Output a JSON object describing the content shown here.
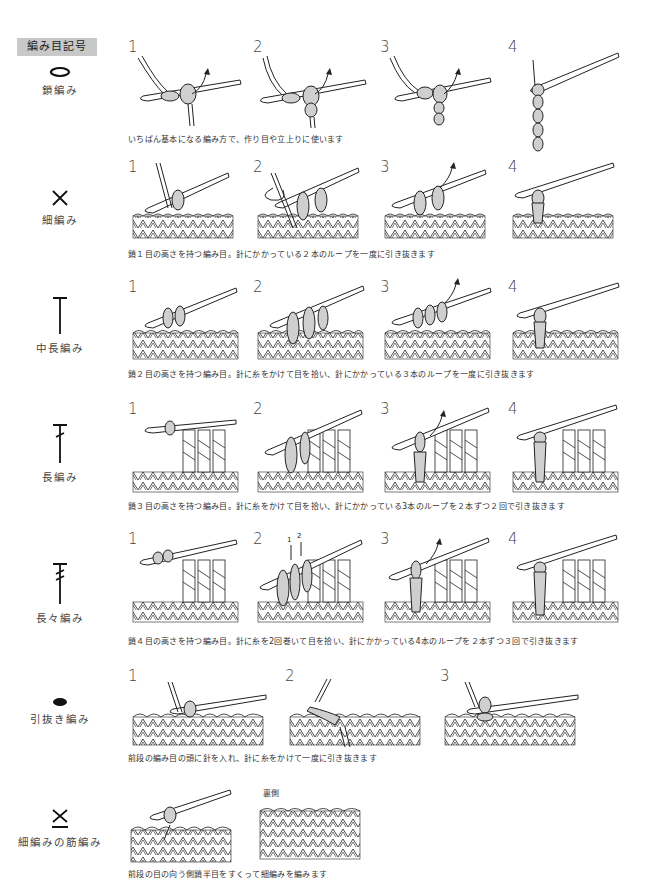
{
  "header": {
    "label": "編み目記号"
  },
  "stitches": [
    {
      "name": "鎖編み",
      "symbol": "oval-outline",
      "steps": [
        "1",
        "2",
        "3",
        "4"
      ],
      "caption": "いちばん基本になる編み方で、作り目や立上りに使います"
    },
    {
      "name": "細編み",
      "symbol": "x-cross",
      "steps": [
        "1",
        "2",
        "3",
        "4"
      ],
      "caption": "鎖１目の高さを持つ編み目。針にかかっている２本のループを一度に引き抜きます"
    },
    {
      "name": "中長編み",
      "symbol": "t-bar",
      "steps": [
        "1",
        "2",
        "3",
        "4"
      ],
      "caption": "鎖２目の高さを持つ編み目。針に糸をかけて目を拾い、針にかかっている３本のループを一度に引き抜きます"
    },
    {
      "name": "長編み",
      "symbol": "t-bar-one-slash",
      "steps": [
        "1",
        "2",
        "3",
        "4"
      ],
      "caption": "鎖３目の高さを持つ編み目。針に糸をかけて目を拾い、針にかかっている3本のループを２本ずつ２回で引き抜きます"
    },
    {
      "name": "長々編み",
      "symbol": "t-bar-two-slash",
      "steps": [
        "1",
        "2",
        "3",
        "4"
      ],
      "step2_arrows": [
        "1",
        "2"
      ],
      "caption": "鎖４目の高さを持つ編み目。針に糸を2回巻いて目を拾い、針にかかっている4本のループを２本ずつ３回で引き抜きます"
    },
    {
      "name": "引抜き編み",
      "symbol": "filled-oval",
      "steps": [
        "1",
        "2",
        "3"
      ],
      "caption": "前段の編み目の頭に針を入れ、針に糸をかけて一度に引き抜きます"
    },
    {
      "name": "細編みの筋編み",
      "symbol": "x-cross-underline",
      "steps": [],
      "aside_label": "裏側",
      "caption": "前段の目の向う側鎖半目をすくって細編みを編みます"
    }
  ],
  "colors": {
    "header_bg": "#c8c8c8",
    "yarn": "#cfcfcf",
    "line": "#222222"
  }
}
